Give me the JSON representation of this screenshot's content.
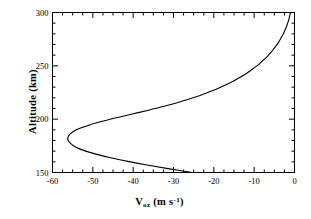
{
  "chart_data": {
    "type": "line",
    "title": "",
    "subtitle": "",
    "xlabel": "V_oz (m s^-1)",
    "ylabel": "Altitude (km)",
    "xlabel_parts": {
      "symbol": "V",
      "subscript": "oz",
      "units_open": " (m s",
      "exponent": "-1",
      "units_close": ")"
    },
    "xlim": [
      -60,
      0
    ],
    "ylim": [
      150,
      300
    ],
    "x_major_ticks": [
      -60,
      -50,
      -40,
      -30,
      -20,
      -10,
      0
    ],
    "x_major_tick_labels": [
      "-60",
      "-50",
      "-40",
      "-30",
      "-20",
      "-10",
      "0"
    ],
    "x_minor_tick_step": 2.5,
    "y_major_ticks": [
      150,
      200,
      250,
      300
    ],
    "y_major_tick_labels": [
      "150",
      "200",
      "250",
      "300"
    ],
    "y_minor_tick_step": 10,
    "grid": false,
    "legend": null,
    "line_color": "#000000",
    "frame_color": "#000000",
    "background_color": "#ffffff",
    "series": [
      {
        "name": "Voz",
        "x": [
          -25.4,
          -31.0,
          -36.2,
          -41.0,
          -45.3,
          -49.0,
          -52.1,
          -54.3,
          -55.6,
          -56.2,
          -56.0,
          -55.0,
          -53.2,
          -50.6,
          -47.4,
          -43.8,
          -40.0,
          -36.2,
          -32.6,
          -29.3,
          -26.3,
          -23.6,
          -21.2,
          -19.0,
          -17.0,
          -15.2,
          -13.6,
          -12.1,
          -10.8,
          -9.6,
          -8.5,
          -7.5,
          -6.6,
          -5.8,
          -5.1,
          -4.4,
          -3.8,
          -3.3,
          -2.8,
          -2.4,
          -2.0,
          -1.7,
          -1.4,
          -1.2,
          -1.0
        ],
        "y": [
          150,
          153.4,
          156.8,
          160.2,
          163.6,
          167.0,
          170.5,
          174.0,
          177.5,
          181.0,
          184.5,
          188.0,
          191.4,
          194.8,
          198.2,
          201.6,
          205.0,
          208.4,
          211.8,
          215.2,
          218.6,
          222.0,
          225.4,
          228.8,
          232.2,
          235.6,
          239.0,
          242.4,
          245.8,
          249.2,
          252.6,
          256.0,
          259.4,
          262.8,
          266.2,
          269.6,
          273.0,
          276.4,
          279.8,
          283.2,
          286.6,
          290.0,
          293.4,
          296.8,
          300
        ]
      }
    ],
    "annotations": {
      "minimum_value": -56.2,
      "minimum_altitude": 190,
      "value_at_150km": -25.4,
      "value_at_300km": -1.0
    }
  }
}
